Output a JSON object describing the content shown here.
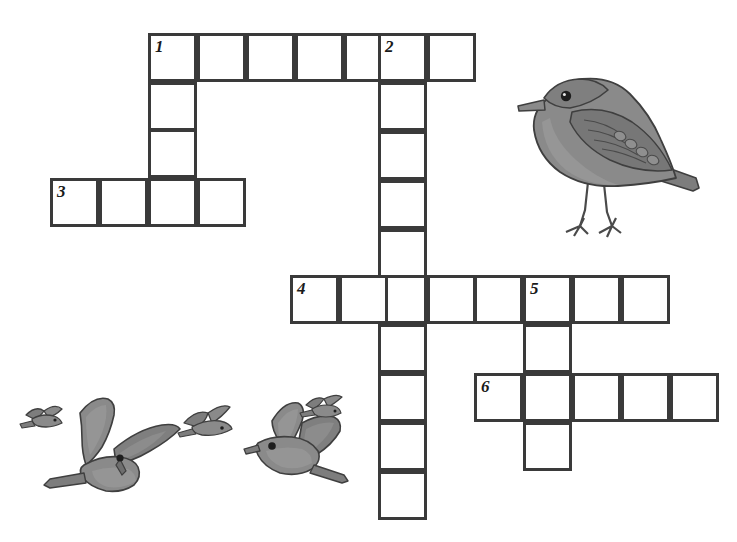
{
  "page": {
    "width": 737,
    "height": 542,
    "background_color": "#ffffff"
  },
  "grid": {
    "cell_size": 49,
    "stroke_color": "#3a3a3a",
    "stroke_width": 3,
    "cell_fill": "#ffffff",
    "number_color": "#1a1a1a"
  },
  "entries": [
    {
      "number": "1",
      "direction": "across",
      "length": 7,
      "start_x": 148,
      "start_y": 33,
      "label": "1-Across"
    },
    {
      "number": "1",
      "direction": "down",
      "length": 4,
      "start_x": 148,
      "start_y": 33,
      "label": "1-Down"
    },
    {
      "number": "2",
      "direction": "down",
      "length": 10,
      "start_x": 378,
      "start_y": 33,
      "label": "2-Down"
    },
    {
      "number": "3",
      "direction": "across",
      "length": 4,
      "start_x": 50,
      "start_y": 178,
      "label": "3-Across"
    },
    {
      "number": "4",
      "direction": "across",
      "length": 8,
      "start_x": 290,
      "start_y": 275,
      "label": "4-Across"
    },
    {
      "number": "5",
      "direction": "down",
      "length": 4,
      "start_x": 523,
      "start_y": 275,
      "label": "5-Down"
    },
    {
      "number": "6",
      "direction": "across",
      "length": 5,
      "start_x": 474,
      "start_y": 373,
      "label": "6-Across"
    }
  ],
  "cells": [
    {
      "id": "c-1a-0",
      "x": 148,
      "y": 33,
      "number": "1",
      "letter": ""
    },
    {
      "id": "c-1a-1",
      "x": 197,
      "y": 33,
      "number": "",
      "letter": ""
    },
    {
      "id": "c-1a-2",
      "x": 246,
      "y": 33,
      "number": "",
      "letter": ""
    },
    {
      "id": "c-1a-3",
      "x": 295,
      "y": 33,
      "number": "",
      "letter": ""
    },
    {
      "id": "c-1a-4",
      "x": 344,
      "y": 33,
      "number": "",
      "letter": ""
    },
    {
      "id": "c-1a-5",
      "x": 378,
      "y": 33,
      "number": "2",
      "letter": ""
    },
    {
      "id": "c-1a-6",
      "x": 427,
      "y": 33,
      "number": "",
      "letter": ""
    },
    {
      "id": "c-1d-1",
      "x": 148,
      "y": 82,
      "number": "",
      "letter": ""
    },
    {
      "id": "c-1d-2",
      "x": 148,
      "y": 129,
      "number": "",
      "letter": ""
    },
    {
      "id": "c-1d-3",
      "x": 148,
      "y": 178,
      "number": "",
      "letter": ""
    },
    {
      "id": "c-3a-0",
      "x": 50,
      "y": 178,
      "number": "3",
      "letter": ""
    },
    {
      "id": "c-3a-1",
      "x": 99,
      "y": 178,
      "number": "",
      "letter": ""
    },
    {
      "id": "c-3a-3",
      "x": 197,
      "y": 178,
      "number": "",
      "letter": ""
    },
    {
      "id": "c-2d-1",
      "x": 378,
      "y": 82,
      "number": "",
      "letter": ""
    },
    {
      "id": "c-2d-2",
      "x": 378,
      "y": 131,
      "number": "",
      "letter": ""
    },
    {
      "id": "c-2d-3",
      "x": 378,
      "y": 180,
      "number": "",
      "letter": ""
    },
    {
      "id": "c-2d-4",
      "x": 378,
      "y": 229,
      "number": "",
      "letter": ""
    },
    {
      "id": "c-2d-5",
      "x": 378,
      "y": 275,
      "number": "",
      "letter": ""
    },
    {
      "id": "c-2d-6",
      "x": 378,
      "y": 324,
      "number": "",
      "letter": ""
    },
    {
      "id": "c-2d-7",
      "x": 378,
      "y": 373,
      "number": "",
      "letter": ""
    },
    {
      "id": "c-2d-8",
      "x": 378,
      "y": 422,
      "number": "",
      "letter": ""
    },
    {
      "id": "c-2d-9",
      "x": 378,
      "y": 471,
      "number": "",
      "letter": ""
    },
    {
      "id": "c-4a-0",
      "x": 290,
      "y": 275,
      "number": "4",
      "letter": ""
    },
    {
      "id": "c-4a-1",
      "x": 339,
      "y": 275,
      "number": "",
      "letter": ""
    },
    {
      "id": "c-4a-3",
      "x": 427,
      "y": 275,
      "number": "",
      "letter": ""
    },
    {
      "id": "c-4a-4",
      "x": 474,
      "y": 275,
      "number": "",
      "letter": ""
    },
    {
      "id": "c-4a-5",
      "x": 523,
      "y": 275,
      "number": "5",
      "letter": ""
    },
    {
      "id": "c-4a-6",
      "x": 572,
      "y": 275,
      "number": "",
      "letter": ""
    },
    {
      "id": "c-4a-7",
      "x": 621,
      "y": 275,
      "number": "",
      "letter": ""
    },
    {
      "id": "c-5d-1",
      "x": 523,
      "y": 324,
      "number": "",
      "letter": ""
    },
    {
      "id": "c-5d-2",
      "x": 523,
      "y": 373,
      "number": "",
      "letter": ""
    },
    {
      "id": "c-5d-3",
      "x": 523,
      "y": 422,
      "number": "",
      "letter": ""
    },
    {
      "id": "c-6a-0",
      "x": 474,
      "y": 373,
      "number": "6",
      "letter": ""
    },
    {
      "id": "c-6a-1",
      "x": 572,
      "y": 373,
      "number": "",
      "letter": ""
    },
    {
      "id": "c-6a-2",
      "x": 621,
      "y": 373,
      "number": "",
      "letter": ""
    },
    {
      "id": "c-6a-3",
      "x": 670,
      "y": 373,
      "number": "",
      "letter": ""
    }
  ],
  "illustrations": [
    {
      "id": "perched-bird",
      "name": "perched-bird-illustration",
      "description": "Gray perched songbird facing left",
      "x": 500,
      "y": 60,
      "width": 205,
      "height": 180,
      "body_color": "#8a8a8a",
      "shade_color": "#6e6e6e",
      "outline_color": "#3f3f3f"
    },
    {
      "id": "flying-birds",
      "name": "flying-birds-illustration",
      "description": "Flock of five gray birds in flight",
      "x": 10,
      "y": 393,
      "width": 340,
      "height": 125,
      "body_color": "#8a8a8a",
      "shade_color": "#6e6e6e",
      "outline_color": "#3f3f3f"
    }
  ]
}
